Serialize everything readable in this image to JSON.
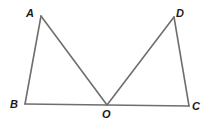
{
  "diagram": {
    "type": "geometry",
    "points": {
      "A": {
        "label": "A",
        "x": 41,
        "y": 16,
        "lx": 26,
        "ly": 17
      },
      "D": {
        "label": "D",
        "x": 174,
        "y": 17,
        "lx": 176,
        "ly": 17
      },
      "B": {
        "label": "B",
        "x": 25,
        "y": 104,
        "lx": 10,
        "ly": 108
      },
      "O": {
        "label": "O",
        "x": 107,
        "y": 105,
        "lx": 102,
        "ly": 118
      },
      "C": {
        "label": "C",
        "x": 189,
        "y": 106,
        "lx": 192,
        "ly": 110
      }
    },
    "segments": [
      {
        "name": "AB",
        "from": "A",
        "to": "B"
      },
      {
        "name": "AO",
        "from": "A",
        "to": "O"
      },
      {
        "name": "DO",
        "from": "D",
        "to": "O"
      },
      {
        "name": "DC",
        "from": "D",
        "to": "C"
      },
      {
        "name": "BC",
        "from": "B",
        "to": "C"
      }
    ],
    "line_color": "#6e6e6e"
  }
}
